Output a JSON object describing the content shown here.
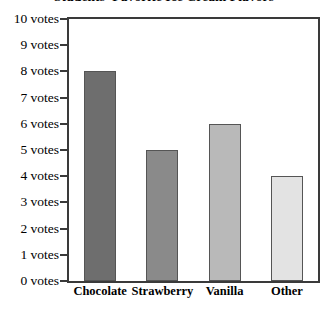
{
  "chart_data": {
    "type": "bar",
    "title": "Students' Favorite Ice Cream Flavors",
    "xlabel": "",
    "ylabel": "",
    "categories": [
      "Chocolate",
      "Strawberry",
      "Vanilla",
      "Other"
    ],
    "values": [
      8,
      5,
      6,
      4
    ],
    "ylim": [
      0,
      10
    ],
    "ytick_values": [
      0,
      1,
      2,
      3,
      4,
      5,
      6,
      7,
      8,
      9,
      10
    ],
    "ytick_labels": [
      "0 votes",
      "1 votes",
      "2 votes",
      "3 votes",
      "4 votes",
      "5 votes",
      "6 votes",
      "7 votes",
      "8 votes",
      "9 votes",
      "10 votes"
    ],
    "grid": false,
    "legend": "none",
    "bar_colors": [
      "#6e6e6e",
      "#8a8a8a",
      "#b9b9b9",
      "#e3e3e3"
    ],
    "bar_edge_color": "#555555",
    "frame_color": "#3a3a3a",
    "background_color": "#ffffff",
    "text_color": "#000000",
    "note": "Title is clipped by the top edge of the screenshot"
  }
}
